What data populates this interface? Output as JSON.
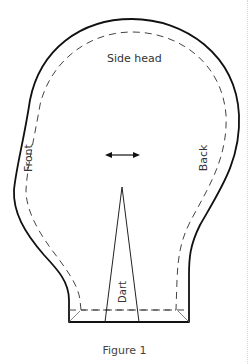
{
  "figure": {
    "caption": "Figure 1",
    "labels": {
      "top": "Side head",
      "left": "Front",
      "right": "Back",
      "dart": "Dart"
    },
    "grainline": "double-headed-arrow",
    "colors": {
      "outline": "#111111",
      "seam_allowance": "#444444",
      "text": "#333333",
      "background": "#ffffff"
    }
  }
}
